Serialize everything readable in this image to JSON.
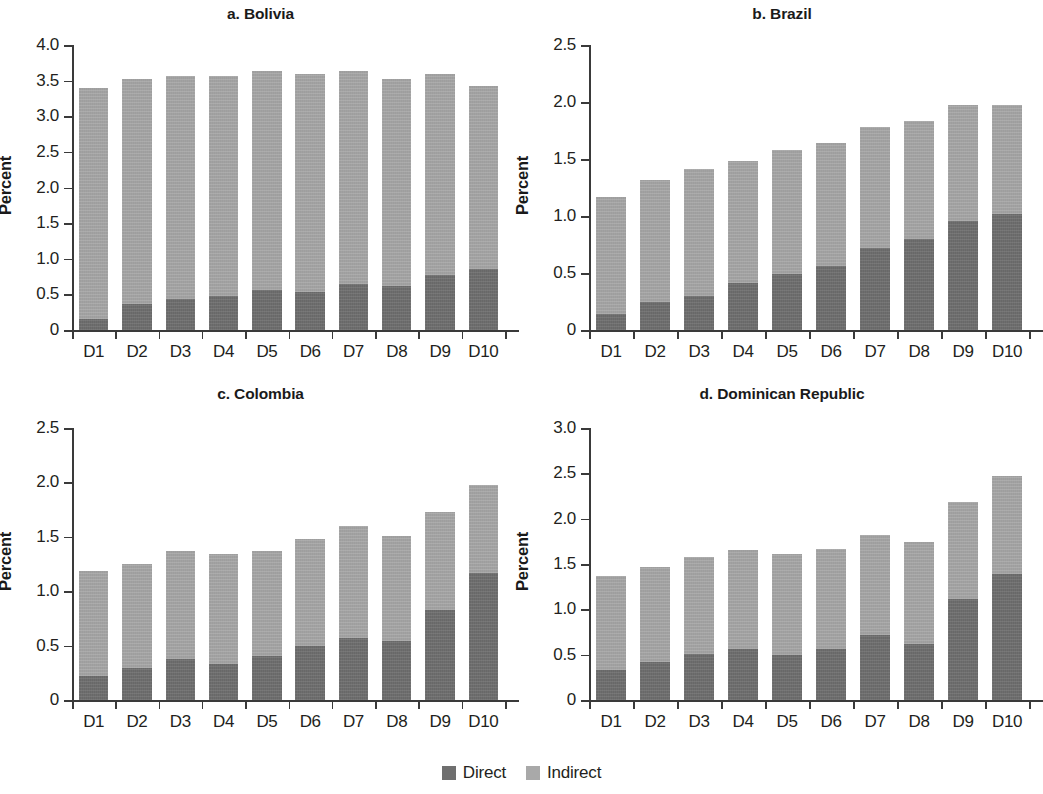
{
  "figure": {
    "width": 1043,
    "height": 794,
    "background": "#ffffff"
  },
  "legend": {
    "position": "bottom-center",
    "items": [
      {
        "label": "Direct",
        "color": "#6f6f6f",
        "swatch_name": "legend-swatch-direct"
      },
      {
        "label": "Indirect",
        "color": "#a9a9a9",
        "swatch_name": "legend-swatch-indirect"
      }
    ]
  },
  "chart_data": [
    {
      "id": "bolivia",
      "type": "bar",
      "stacked": true,
      "title": "a. Bolivia",
      "xlabel": "",
      "ylabel": "Percent",
      "ylim": [
        0,
        4.0
      ],
      "yticks": [
        0,
        0.5,
        1.0,
        1.5,
        2.0,
        2.5,
        3.0,
        3.5,
        4.0
      ],
      "ytick_labels": [
        "0",
        "0.5",
        "1.0",
        "1.5",
        "2.0",
        "2.5",
        "3.0",
        "3.5",
        "4.0"
      ],
      "grid": false,
      "categories": [
        "D1",
        "D2",
        "D3",
        "D4",
        "D5",
        "D6",
        "D7",
        "D8",
        "D9",
        "D10"
      ],
      "series": [
        {
          "name": "Direct",
          "color": "#6f6f6f",
          "values": [
            0.16,
            0.36,
            0.44,
            0.48,
            0.56,
            0.53,
            0.65,
            0.62,
            0.77,
            0.85
          ]
        },
        {
          "name": "Indirect",
          "color": "#a9a9a9",
          "values": [
            3.23,
            3.17,
            3.12,
            3.08,
            3.08,
            3.06,
            2.99,
            2.9,
            2.82,
            2.58
          ]
        }
      ],
      "totals": [
        3.39,
        3.53,
        3.56,
        3.56,
        3.64,
        3.59,
        3.64,
        3.52,
        3.59,
        3.43
      ]
    },
    {
      "id": "brazil",
      "type": "bar",
      "stacked": true,
      "title": "b. Brazil",
      "xlabel": "",
      "ylabel": "Percent",
      "ylim": [
        0,
        2.5
      ],
      "yticks": [
        0,
        0.5,
        1.0,
        1.5,
        2.0,
        2.5
      ],
      "ytick_labels": [
        "0",
        "0.5",
        "1.0",
        "1.5",
        "2.0",
        "2.5"
      ],
      "grid": false,
      "categories": [
        "D1",
        "D2",
        "D3",
        "D4",
        "D5",
        "D6",
        "D7",
        "D8",
        "D9",
        "D10"
      ],
      "series": [
        {
          "name": "Direct",
          "color": "#6f6f6f",
          "values": [
            0.14,
            0.25,
            0.3,
            0.41,
            0.49,
            0.56,
            0.72,
            0.8,
            0.96,
            1.02
          ]
        },
        {
          "name": "Indirect",
          "color": "#a9a9a9",
          "values": [
            1.03,
            1.07,
            1.11,
            1.07,
            1.09,
            1.08,
            1.06,
            1.03,
            1.01,
            0.95
          ]
        }
      ],
      "totals": [
        1.17,
        1.32,
        1.41,
        1.48,
        1.58,
        1.64,
        1.78,
        1.83,
        1.97,
        1.97
      ]
    },
    {
      "id": "colombia",
      "type": "bar",
      "stacked": true,
      "title": "c. Colombia",
      "xlabel": "",
      "ylabel": "Percent",
      "ylim": [
        0,
        2.5
      ],
      "yticks": [
        0,
        0.5,
        1.0,
        1.5,
        2.0,
        2.5
      ],
      "ytick_labels": [
        "0",
        "0.5",
        "1.0",
        "1.5",
        "2.0",
        "2.5"
      ],
      "grid": false,
      "categories": [
        "D1",
        "D2",
        "D3",
        "D4",
        "D5",
        "D6",
        "D7",
        "D8",
        "D9",
        "D10"
      ],
      "series": [
        {
          "name": "Direct",
          "color": "#6f6f6f",
          "values": [
            0.22,
            0.29,
            0.38,
            0.33,
            0.4,
            0.5,
            0.57,
            0.54,
            0.83,
            1.17
          ]
        },
        {
          "name": "Indirect",
          "color": "#a9a9a9",
          "values": [
            0.97,
            0.96,
            0.99,
            1.01,
            0.97,
            0.98,
            1.03,
            0.97,
            0.9,
            0.81
          ]
        }
      ],
      "totals": [
        1.19,
        1.25,
        1.37,
        1.34,
        1.37,
        1.48,
        1.6,
        1.51,
        1.73,
        1.98
      ]
    },
    {
      "id": "dominican-republic",
      "type": "bar",
      "stacked": true,
      "title": "d. Dominican Republic",
      "xlabel": "",
      "ylabel": "Percent",
      "ylim": [
        0,
        3.0
      ],
      "yticks": [
        0,
        0.5,
        1.0,
        1.5,
        2.0,
        2.5,
        3.0
      ],
      "ytick_labels": [
        "0",
        "0.5",
        "1.0",
        "1.5",
        "2.0",
        "2.5",
        "3.0"
      ],
      "grid": false,
      "categories": [
        "D1",
        "D2",
        "D3",
        "D4",
        "D5",
        "D6",
        "D7",
        "D8",
        "D9",
        "D10"
      ],
      "series": [
        {
          "name": "Direct",
          "color": "#6f6f6f",
          "values": [
            0.33,
            0.42,
            0.51,
            0.56,
            0.5,
            0.56,
            0.72,
            0.62,
            1.11,
            1.39
          ]
        },
        {
          "name": "Indirect",
          "color": "#a9a9a9",
          "values": [
            1.04,
            1.05,
            1.07,
            1.1,
            1.11,
            1.11,
            1.1,
            1.12,
            1.07,
            1.08
          ]
        }
      ],
      "totals": [
        1.37,
        1.47,
        1.58,
        1.66,
        1.61,
        1.67,
        1.82,
        1.74,
        2.18,
        2.47
      ]
    }
  ]
}
